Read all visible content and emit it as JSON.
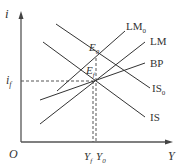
{
  "diagram": {
    "type": "IS-LM-BP",
    "axes": {
      "y_label": "i",
      "x_label": "Y",
      "origin_label": "O"
    },
    "curves": [
      {
        "name": "LM0",
        "label": "LM",
        "sub": "0"
      },
      {
        "name": "LM",
        "label": "LM",
        "sub": ""
      },
      {
        "name": "BP",
        "label": "BP",
        "sub": ""
      },
      {
        "name": "IS0",
        "label": "IS",
        "sub": "0"
      },
      {
        "name": "IS",
        "label": "IS",
        "sub": ""
      }
    ],
    "points": [
      {
        "name": "E0",
        "label": "E",
        "sub": "0"
      },
      {
        "name": "Ef",
        "label": "E",
        "sub": "f"
      }
    ],
    "markers": {
      "i_f": {
        "label": "i",
        "sub": "f"
      },
      "Y_f": {
        "label": "Y",
        "sub": "f"
      },
      "Y_0": {
        "label": "Y",
        "sub": "0"
      }
    },
    "colors": {
      "line": "#333333",
      "background": "#ffffff"
    }
  }
}
